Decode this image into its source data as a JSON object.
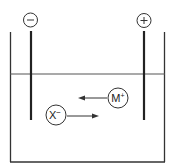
{
  "diagram": {
    "title": "",
    "electrodes": [
      {
        "label": "−",
        "polarity": "negative",
        "name": "cathode"
      },
      {
        "label": "+",
        "polarity": "positive",
        "name": "anode"
      }
    ],
    "ions": [
      {
        "label": "M",
        "charge": "+",
        "direction": "toward negative electrode (left)"
      },
      {
        "label": "X",
        "charge": "−",
        "direction": "toward positive electrode (right)"
      }
    ],
    "colors": {
      "stroke": "#333333",
      "background": "#ffffff"
    }
  }
}
